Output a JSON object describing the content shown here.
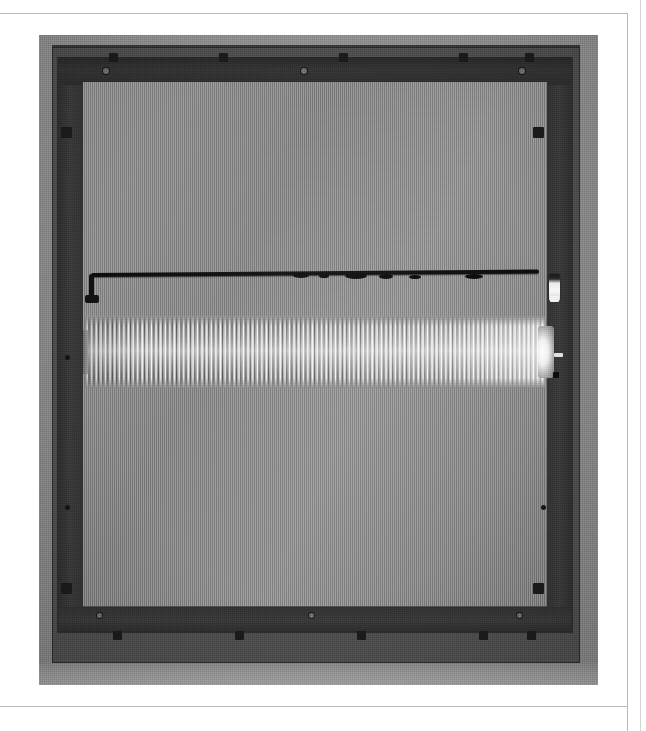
{
  "document": {
    "kind": "photographic figure on a printed page",
    "background_color": "#ffffff",
    "border_rule_color": "#b8b8b8"
  },
  "photo": {
    "description": "Black and white photograph of a rectangular backlight / screen panel assembly viewed face-on, showing the dark outer frame, a gray mesh diffuser panel, a black horizontal wire harness with a white connector at its right end, and a horizontal ribbed cylindrical lamp tube with bright specular highlights.",
    "dominant_tone": "#8d8d8d",
    "frame_tone": "#3a3a3a",
    "panel_tone": "#8e8e8e",
    "tube_highlight": "#ffffff",
    "cable_tone": "#0d0d0d",
    "connector_tone": "#f4f4f4"
  },
  "parts": {
    "outer_frame": "outer dark chassis frame",
    "top_rail": "upper mounting rail with clip tabs",
    "bottom_rail": "lower mounting rail with clip tabs",
    "left_rail": "left side rail",
    "right_rail": "right side rail",
    "mesh_panel": "gray diffuser / mesh screen panel",
    "cable": "black horizontal wiring harness",
    "connector": "white wire connector at right end of harness",
    "tube": "ribbed cylindrical lamp tube",
    "tube_cap": "bright end cap of the tube"
  },
  "top_rail_tabs": [
    {
      "left": 70
    },
    {
      "left": 180
    },
    {
      "left": 300
    },
    {
      "left": 420
    },
    {
      "left": 486
    }
  ],
  "top_rail_screws": [
    {
      "left": 64
    },
    {
      "left": 262
    },
    {
      "left": 480
    }
  ],
  "bottom_rail_tabs": [
    {
      "left": 74
    },
    {
      "left": 196
    },
    {
      "left": 318
    },
    {
      "left": 440
    },
    {
      "left": 488
    }
  ],
  "bottom_rail_screws": [
    {
      "left": 58
    },
    {
      "left": 270
    },
    {
      "left": 478
    }
  ],
  "corner_tabs": [
    {
      "left": 22,
      "top": 92
    },
    {
      "left": 494,
      "top": 92
    },
    {
      "left": 22,
      "top": 548
    },
    {
      "left": 494,
      "top": 548
    }
  ],
  "side_screws": [
    {
      "left": 26,
      "top": 320
    },
    {
      "left": 502,
      "top": 308
    },
    {
      "left": 26,
      "top": 470
    },
    {
      "left": 502,
      "top": 470
    }
  ],
  "cable_lumps": [
    {
      "left": 210,
      "width": 16,
      "height": 5
    },
    {
      "left": 236,
      "width": 10,
      "height": 4
    },
    {
      "left": 262,
      "width": 22,
      "height": 6
    },
    {
      "left": 296,
      "width": 14,
      "height": 5
    },
    {
      "left": 326,
      "width": 12,
      "height": 4
    },
    {
      "left": 382,
      "width": 18,
      "height": 5
    }
  ]
}
